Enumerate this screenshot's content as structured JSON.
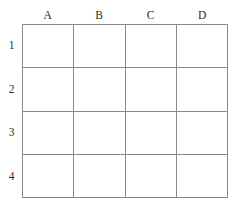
{
  "figure": {
    "type": "empty-grid-table",
    "rows": 4,
    "columns": 4,
    "line_color": "#8a8a8a",
    "cell_background": "#ffffff",
    "page_background": "#ffffff",
    "label_color": "#2b2b2b"
  },
  "column_headers": [
    {
      "label": "A"
    },
    {
      "label": "B"
    },
    {
      "label": "C"
    },
    {
      "label": "D"
    }
  ],
  "row_labels": [
    {
      "label": "1"
    },
    {
      "label": "2"
    },
    {
      "label": "3"
    },
    {
      "label": "4"
    }
  ],
  "cells": [
    [
      {
        "value": ""
      },
      {
        "value": ""
      },
      {
        "value": ""
      },
      {
        "value": ""
      }
    ],
    [
      {
        "value": ""
      },
      {
        "value": ""
      },
      {
        "value": ""
      },
      {
        "value": ""
      }
    ],
    [
      {
        "value": ""
      },
      {
        "value": ""
      },
      {
        "value": ""
      },
      {
        "value": ""
      }
    ],
    [
      {
        "value": ""
      },
      {
        "value": ""
      },
      {
        "value": ""
      },
      {
        "value": ""
      }
    ]
  ]
}
